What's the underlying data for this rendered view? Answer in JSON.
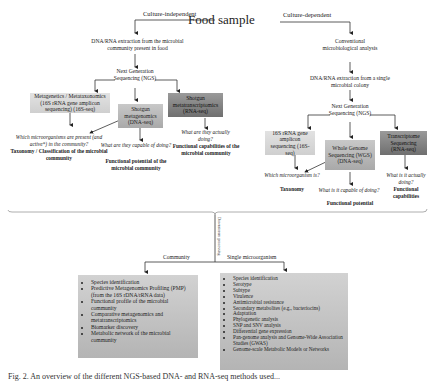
{
  "title": "Food sample",
  "branches": {
    "left_label": "Culture-independent",
    "right_label": "Culture-dependent"
  },
  "left": {
    "extraction": "DNA/RNA extraction from the microbial community present in food",
    "ngs": "Next Generation Sequencing (NGS)",
    "boxes": [
      {
        "label": "Metagenetics / Metataxonomics (16S rRNA gene amplicon sequencing) (16S-seq)",
        "shade": "light"
      },
      {
        "label": "Shotgun metagenomics (DNA-seq)",
        "shade": "mid"
      },
      {
        "label": "Shotgun metatranscriptomics (RNA-seq)",
        "shade": "dark"
      }
    ],
    "outcomes": [
      {
        "question": "Which microorganisms are present (and active*) in the community?",
        "answer": "Taxonomy / Classification of the microbial community"
      },
      {
        "question": "What are they capable of doing?",
        "answer": "Functional potential of the microbial community"
      },
      {
        "question": "What are they actually doing?",
        "answer": "Functional capabilities of the microbial community"
      }
    ]
  },
  "right": {
    "conventional": "Conventional microbiological analysis",
    "extraction": "DNA/RNA extraction from a single microbial colony",
    "ngs": "Next Generation Sequencing (NGS)",
    "boxes": [
      {
        "label": "16S rRNA gene amplicon sequencing (16S-seq)",
        "shade": "light"
      },
      {
        "label": "Whole Genome Sequencing (WGS) (DNA-seq)",
        "shade": "mid"
      },
      {
        "label": "Transcriptome Sequencing (RNA-seq)",
        "shade": "dark"
      }
    ],
    "outcomes": [
      {
        "question": "Which microorganism is?",
        "answer": "Taxonomy"
      },
      {
        "question": "What is it capable of doing?",
        "answer": "Functional potential"
      },
      {
        "question": "What is it actually doing?",
        "answer": "Functional capabilities"
      }
    ]
  },
  "downstream": {
    "vertical_label": "Downstream processing",
    "community_label": "Community",
    "single_label": "Single microorganism",
    "community_items": [
      "Species identification",
      "Predictive Metagenomics Profiling (PMP) (from the 16S rDNA/rRNA data)",
      "Functional profile of the microbial community",
      "Comparative metagenomics and metatranscriptomics",
      "Biomarker discovery",
      "Metabolic network of the microbial community"
    ],
    "single_items": [
      "Species identification",
      "Serotype",
      "Subtype",
      "Virulence",
      "Antimicrobial resistance",
      "Secondary metabolites (e.g., bacteriocins)",
      "Adaptation",
      "Phylogenetic analysis",
      "SNP and SNV analysis",
      "Differential gene expression",
      "Pan-genome analysis and Genome-Wide Association Studies (GWAS)",
      "Genome-scale Metabolic Models or Networks"
    ]
  },
  "caption": "Fig. 2. An overview of the different NGS-based DNA- and RNA-seq methods used..."
}
